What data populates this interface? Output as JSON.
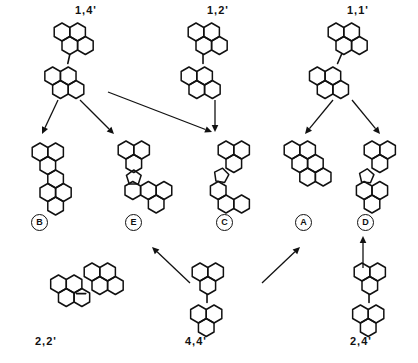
{
  "diagram": {
    "background": "#ffffff",
    "ink": "#111111"
  },
  "reactants": [
    {
      "id": "r14",
      "label": "1,4'",
      "x": 75,
      "y": 4,
      "mol_x": 52,
      "mol_y": 18,
      "motif": "biaryl-vertical-offset"
    },
    {
      "id": "r12",
      "label": "1,2'",
      "x": 207,
      "y": 4,
      "mol_x": 186,
      "mol_y": 18,
      "motif": "biaryl-vertical"
    },
    {
      "id": "r11",
      "label": "1,1'",
      "x": 347,
      "y": 4,
      "mol_x": 308,
      "mol_y": 18,
      "motif": "biaryl-diagonal"
    }
  ],
  "products": [
    {
      "id": "pB",
      "letter": "B",
      "mol_x": 18,
      "mol_y": 140,
      "circ_x": 31,
      "circ_y": 214,
      "motif": "fused-angular-ribbon"
    },
    {
      "id": "pE",
      "letter": "E",
      "mol_x": 100,
      "mol_y": 140,
      "circ_x": 125,
      "circ_y": 214,
      "motif": "fused-cross-5ring"
    },
    {
      "id": "pC",
      "letter": "C",
      "mol_x": 200,
      "mol_y": 138,
      "circ_x": 216,
      "circ_y": 214,
      "motif": "fused-angular-5ring"
    },
    {
      "id": "pA",
      "letter": "A",
      "mol_x": 272,
      "mol_y": 140,
      "circ_x": 295,
      "circ_y": 214,
      "motif": "fused-linear-ribbon"
    },
    {
      "id": "pD",
      "letter": "D",
      "mol_x": 330,
      "mol_y": 140,
      "circ_x": 357,
      "circ_y": 214,
      "motif": "fused-diagonal-5ring"
    }
  ],
  "lower_reactants": [
    {
      "id": "r22",
      "label": "2,2'",
      "x": 35,
      "y": 335,
      "mol_x": 22,
      "mol_y": 262,
      "motif": "biaryl-diagonal-low"
    },
    {
      "id": "r44",
      "label": "4,4'",
      "x": 185,
      "y": 335,
      "mol_x": 178,
      "mol_y": 258,
      "motif": "biaryl-vertical-low"
    },
    {
      "id": "r24",
      "label": "2,4'",
      "x": 350,
      "y": 335,
      "mol_x": 340,
      "mol_y": 258,
      "motif": "biaryl-vertical-low2"
    }
  ],
  "arrows": [
    {
      "id": "a-14-B",
      "from": "1,4'",
      "to": "B",
      "x1": 58,
      "y1": 100,
      "x2": 42,
      "y2": 134
    },
    {
      "id": "a-14-E",
      "from": "1,4'",
      "to": "E",
      "x1": 80,
      "y1": 100,
      "x2": 114,
      "y2": 134
    },
    {
      "id": "a-14-C",
      "from": "1,4'",
      "to": "C",
      "x1": 108,
      "y1": 92,
      "x2": 212,
      "y2": 132
    },
    {
      "id": "a-12-C",
      "from": "1,2'",
      "to": "C",
      "x1": 215,
      "y1": 100,
      "x2": 215,
      "y2": 132
    },
    {
      "id": "a-11-A",
      "from": "1,1'",
      "to": "A",
      "x1": 333,
      "y1": 100,
      "x2": 305,
      "y2": 134
    },
    {
      "id": "a-11-D",
      "from": "1,1'",
      "to": "D",
      "x1": 352,
      "y1": 100,
      "x2": 380,
      "y2": 134
    },
    {
      "id": "a-44-E",
      "from": "4,4'",
      "to": "E",
      "x1": 190,
      "y1": 283,
      "x2": 152,
      "y2": 247
    },
    {
      "id": "a-44-A",
      "from": "4,4'",
      "to": "A",
      "x1": 262,
      "y1": 283,
      "x2": 300,
      "y2": 247
    },
    {
      "id": "a-24-D",
      "from": "2,4'",
      "to": "D",
      "x1": 363,
      "y1": 268,
      "x2": 363,
      "y2": 236
    }
  ]
}
